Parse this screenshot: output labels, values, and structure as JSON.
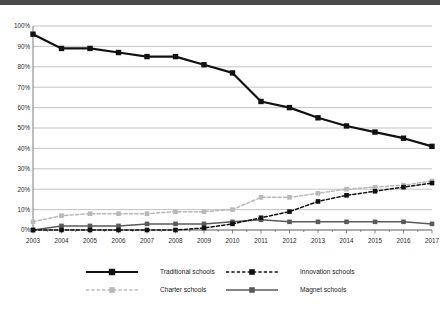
{
  "chart_data": {
    "type": "line",
    "title": "",
    "xlabel": "",
    "ylabel": "",
    "ylim": [
      0,
      100
    ],
    "ytick_labels": [
      "0%",
      "10%",
      "20%",
      "30%",
      "40%",
      "50%",
      "60%",
      "70%",
      "80%",
      "90%",
      "100%"
    ],
    "ytick_values": [
      0,
      10,
      20,
      30,
      40,
      50,
      60,
      70,
      80,
      90,
      100
    ],
    "grid": true,
    "legend_position": "bottom",
    "categories": [
      "2003",
      "2004",
      "2005",
      "2006",
      "2007",
      "2008",
      "2009",
      "2010",
      "2011",
      "2012",
      "2013",
      "2014",
      "2015",
      "2016",
      "2017"
    ],
    "series": [
      {
        "name": "Traditional schools",
        "color": "#111111",
        "style": "solid",
        "marker": "square",
        "values": [
          96,
          89,
          89,
          87,
          85,
          85,
          81,
          77,
          63,
          60,
          55,
          51,
          48,
          45,
          41
        ]
      },
      {
        "name": "Innovation schools",
        "color": "#111111",
        "style": "dashed",
        "marker": "square",
        "values": [
          0,
          0,
          0,
          0,
          0,
          0,
          1,
          3,
          6,
          9,
          14,
          17,
          19,
          21,
          23
        ]
      },
      {
        "name": "Charter schools",
        "color": "#b8b8b8",
        "style": "dashed",
        "marker": "square",
        "values": [
          4,
          7,
          8,
          8,
          8,
          9,
          9,
          10,
          16,
          16,
          18,
          20,
          21,
          22,
          24
        ]
      },
      {
        "name": "Magnet schools",
        "color": "#5a5a5a",
        "style": "solid",
        "marker": "square",
        "values": [
          0,
          2,
          2,
          2,
          3,
          3,
          3,
          4,
          5,
          4,
          4,
          4,
          4,
          4,
          3
        ]
      }
    ]
  },
  "legend": {
    "items": [
      {
        "label": "Traditional schools"
      },
      {
        "label": "Innovation schools"
      },
      {
        "label": "Charter schools"
      },
      {
        "label": "Magnet schools"
      }
    ]
  }
}
